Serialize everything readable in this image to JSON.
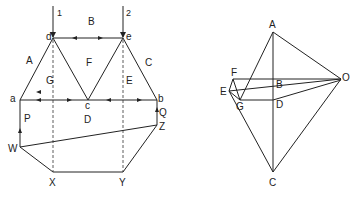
{
  "truss_diagram": {
    "load_labels": [
      "1",
      "2"
    ],
    "joint_labels": {
      "a": "a",
      "b": "b",
      "c": "c",
      "d": "d",
      "e": "e"
    },
    "space_labels": {
      "A": "A",
      "B": "B",
      "C": "C",
      "D": "D",
      "E": "E",
      "F": "F",
      "G": "G"
    },
    "reaction_labels": {
      "P": "P",
      "Q": "Q"
    },
    "funicular_labels": {
      "W": "W",
      "X": "X",
      "Y": "Y",
      "Z": "Z"
    }
  },
  "force_diagram": {
    "labels": {
      "A": "A",
      "B": "B",
      "C": "C",
      "D": "D",
      "E": "E",
      "F": "F",
      "G": "G",
      "O": "O"
    }
  }
}
